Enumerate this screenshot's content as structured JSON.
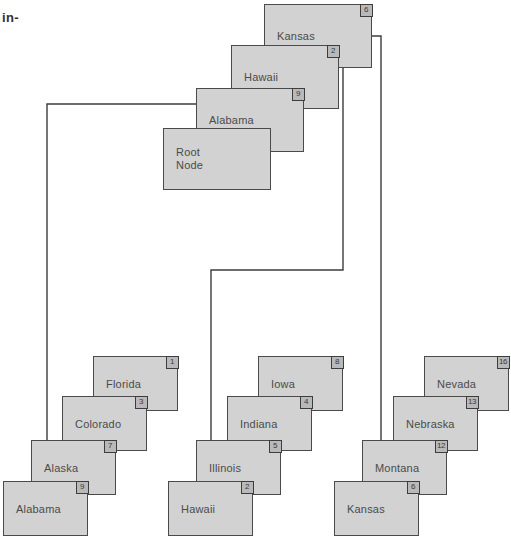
{
  "page": {
    "margin_text": "in-",
    "background_color": "#ffffff",
    "node_fill": "#d2d2d2",
    "node_border": "#4a4a4a",
    "badge_fill": "#b9b9b9",
    "edge_color": "#3c3c3c"
  },
  "diagram": {
    "type": "cascading-stack-tree",
    "stacks": [
      {
        "name": "root-stack",
        "nodes": [
          {
            "label": "Kansas",
            "badge": "6",
            "x": 264,
            "y": 4,
            "w": 108,
            "h": 64
          },
          {
            "label": "Hawaii",
            "badge": "2",
            "x": 231,
            "y": 45,
            "w": 108,
            "h": 64
          },
          {
            "label": "Alabama",
            "badge": "9",
            "x": 196,
            "y": 88,
            "w": 108,
            "h": 64
          },
          {
            "label": "Root\nNode",
            "badge": "",
            "x": 163,
            "y": 128,
            "w": 108,
            "h": 62
          }
        ]
      },
      {
        "name": "left-stack",
        "nodes": [
          {
            "label": "Florida",
            "badge": "1",
            "x": 93,
            "y": 356,
            "w": 85,
            "h": 55
          },
          {
            "label": "Colorado",
            "badge": "3",
            "x": 62,
            "y": 396,
            "w": 85,
            "h": 55
          },
          {
            "label": "Alaska",
            "badge": "7",
            "x": 31,
            "y": 440,
            "w": 85,
            "h": 55
          },
          {
            "label": "Alabama",
            "badge": "9",
            "x": 3,
            "y": 481,
            "w": 85,
            "h": 55
          }
        ]
      },
      {
        "name": "middle-stack",
        "nodes": [
          {
            "label": "Iowa",
            "badge": "8",
            "x": 258,
            "y": 356,
            "w": 85,
            "h": 55
          },
          {
            "label": "Indiana",
            "badge": "4",
            "x": 227,
            "y": 396,
            "w": 85,
            "h": 55
          },
          {
            "label": "Illinois",
            "badge": "5",
            "x": 196,
            "y": 440,
            "w": 85,
            "h": 55
          },
          {
            "label": "Hawaii",
            "badge": "2",
            "x": 168,
            "y": 481,
            "w": 85,
            "h": 55
          }
        ]
      },
      {
        "name": "right-stack",
        "nodes": [
          {
            "label": "Nevada",
            "badge": "16",
            "x": 424,
            "y": 356,
            "w": 85,
            "h": 55
          },
          {
            "label": "Nebraska",
            "badge": "13",
            "x": 393,
            "y": 396,
            "w": 85,
            "h": 55
          },
          {
            "label": "Montana",
            "badge": "12",
            "x": 362,
            "y": 440,
            "w": 85,
            "h": 55
          },
          {
            "label": "Kansas",
            "badge": "6",
            "x": 334,
            "y": 481,
            "w": 85,
            "h": 55
          }
        ]
      }
    ],
    "edges": [
      {
        "name": "alabama-to-alaska",
        "path": "M 196 104 L 47 104 L 47 475"
      },
      {
        "name": "hawaii-to-illinois",
        "path": "M 339 62 L 343 62 L 343 270 L 211 270 L 211 475"
      },
      {
        "name": "kansas-to-montana",
        "path": "M 372 36 L 381 36 L 381 475"
      }
    ]
  }
}
